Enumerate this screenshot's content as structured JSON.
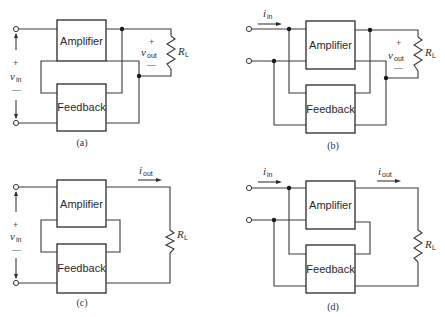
{
  "diagram": {
    "block_labels": {
      "amplifier": "Amplifier",
      "feedback": "Feedback"
    },
    "panels": [
      {
        "id": "a",
        "caption": "(a)",
        "input": {
          "type": "voltage",
          "symbol": "v",
          "subscript": "in",
          "plus": "+",
          "minus": "—"
        },
        "output": {
          "type": "voltage",
          "symbol": "v",
          "subscript": "out",
          "plus": "+",
          "minus": "—"
        },
        "load": {
          "symbol": "R",
          "subscript": "L"
        }
      },
      {
        "id": "b",
        "caption": "(b)",
        "input": {
          "type": "current",
          "symbol": "i",
          "subscript": "in"
        },
        "output": {
          "type": "voltage",
          "symbol": "v",
          "subscript": "out",
          "plus": "+",
          "minus": "—"
        },
        "load": {
          "symbol": "R",
          "subscript": "L"
        }
      },
      {
        "id": "c",
        "caption": "(c)",
        "input": {
          "type": "voltage",
          "symbol": "v",
          "subscript": "in",
          "plus": "+",
          "minus": "—"
        },
        "output": {
          "type": "current",
          "symbol": "i",
          "subscript": "out"
        },
        "load": {
          "symbol": "R",
          "subscript": "L"
        }
      },
      {
        "id": "d",
        "caption": "(d)",
        "input": {
          "type": "current",
          "symbol": "i",
          "subscript": "in"
        },
        "output": {
          "type": "current",
          "symbol": "i",
          "subscript": "out"
        },
        "load": {
          "symbol": "R",
          "subscript": "L"
        }
      }
    ],
    "colors": {
      "line": "#3a3a3a",
      "background": "#ffffff"
    }
  }
}
